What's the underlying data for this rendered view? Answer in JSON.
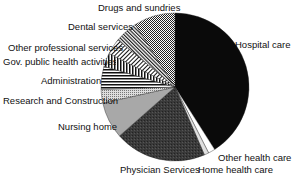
{
  "chart_data": {
    "type": "pie",
    "title": "",
    "start_angle_deg": 0,
    "direction": "clockwise",
    "slices": [
      {
        "label": "Hospital care",
        "value": 41,
        "fill": "#0a0a0a",
        "pattern": "solid"
      },
      {
        "label": "Home health care",
        "value": 1.5,
        "fill": "#ffffff",
        "pattern": "solid"
      },
      {
        "label": "Other health care",
        "value": 1,
        "fill": "#e0e0e0",
        "pattern": "solid"
      },
      {
        "label": "Physician Services",
        "value": 20,
        "fill": "#333333",
        "pattern": "noise"
      },
      {
        "label": "Nursing home",
        "value": 8,
        "fill": "#a8a8a8",
        "pattern": "solid"
      },
      {
        "label": "Research and Construction",
        "value": 3,
        "fill": "#cfcfcf",
        "pattern": "dots"
      },
      {
        "label": "Administration",
        "value": 5,
        "fill": "#ffffff",
        "pattern": "horizontal-lines"
      },
      {
        "label": "Gov. public health activities",
        "value": 3,
        "fill": "#ffffff",
        "pattern": "vertical-lines"
      },
      {
        "label": "Other professional services",
        "value": 3.5,
        "fill": "#ffffff",
        "pattern": "diagonal-lines"
      },
      {
        "label": "Dental services",
        "value": 5,
        "fill": "#ffffff",
        "pattern": "diagonal-lines-dense"
      },
      {
        "label": "Drugs and sundries",
        "value": 9,
        "fill": "#888888",
        "pattern": "crosshatch"
      }
    ]
  },
  "labels": {
    "drugs": "Drugs and sundries",
    "dental": "Dental services",
    "other_prof": "Other professional services",
    "gov": "Gov. public health activities",
    "admin": "Administration",
    "research": "Research and Construction",
    "nursing": "Nursing home",
    "physician": "Physician Services",
    "home": "Home health care",
    "other_health": "Other health care",
    "hospital": "Hospital care"
  }
}
